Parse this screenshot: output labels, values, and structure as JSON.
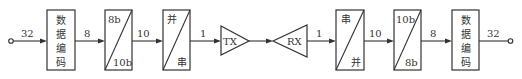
{
  "diagram": {
    "title": "",
    "input_width": "32",
    "output_width": "32",
    "blocks": [
      {
        "id": "encode-tx",
        "type": "box",
        "label_lines": [
          "数",
          "据",
          "编",
          "码"
        ]
      },
      {
        "id": "8b10b",
        "type": "diag-box",
        "top": "8b",
        "bottom": "10b"
      },
      {
        "id": "par2ser",
        "type": "diag-box",
        "top": "并",
        "bottom": "串"
      },
      {
        "id": "tx",
        "type": "triangle-right",
        "label": "TX"
      },
      {
        "id": "rx",
        "type": "triangle-left",
        "label": "RX"
      },
      {
        "id": "ser2par",
        "type": "diag-box",
        "top": "串",
        "bottom": "并"
      },
      {
        "id": "10b8b",
        "type": "diag-box",
        "top": "10b",
        "bottom": "8b"
      },
      {
        "id": "encode-rx",
        "type": "box",
        "label_lines": [
          "数",
          "据",
          "编",
          "码"
        ]
      }
    ],
    "links": [
      {
        "label": "32"
      },
      {
        "label": "8"
      },
      {
        "label": "10"
      },
      {
        "label": "1"
      },
      {
        "label": ""
      },
      {
        "label": "1"
      },
      {
        "label": "10"
      },
      {
        "label": "8"
      },
      {
        "label": "32"
      }
    ]
  }
}
